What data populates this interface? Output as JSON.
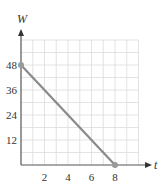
{
  "chart_data": {
    "type": "line",
    "title": "",
    "xlabel": "t",
    "ylabel": "W",
    "x": [
      0,
      8
    ],
    "series": [
      {
        "name": "W",
        "values": [
          48,
          0
        ],
        "color": "#8a8a8a"
      }
    ],
    "points": [
      {
        "x": 0,
        "y": 48
      },
      {
        "x": 8,
        "y": 0
      }
    ],
    "xlim": [
      0,
      10
    ],
    "ylim": [
      0,
      60
    ],
    "xticks": [
      2,
      4,
      6,
      8
    ],
    "yticks": [
      12,
      24,
      36,
      48
    ],
    "grid": true,
    "grid_step_x": 1,
    "grid_step_y": 6,
    "legend": null
  },
  "labels": {
    "x_axis": "t",
    "y_axis": "W",
    "xticks": [
      "2",
      "4",
      "6",
      "8"
    ],
    "yticks": [
      "12",
      "24",
      "36",
      "48"
    ]
  },
  "colors": {
    "line": "#8a8a8a",
    "axis": "#555555",
    "grid": "#dcdcdc",
    "point": "#999999"
  }
}
